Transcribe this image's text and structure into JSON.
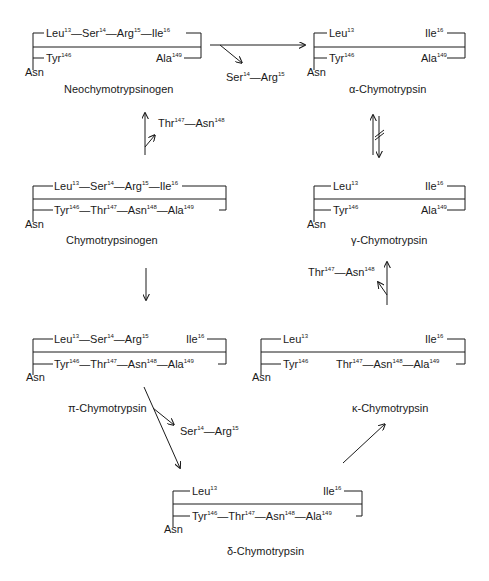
{
  "species": {
    "neochymotrypsinogen": {
      "name": "Neochymotrypsinogen",
      "top": [
        {
          "r": "Leu",
          "n": "13"
        },
        {
          "r": "Ser",
          "n": "14"
        },
        {
          "r": "Arg",
          "n": "15"
        },
        {
          "r": "Ile",
          "n": "16"
        }
      ],
      "bottom_left": {
        "r": "Tyr",
        "n": "146"
      },
      "bottom_right": {
        "r": "Ala",
        "n": "149"
      },
      "terminal": "Asn"
    },
    "alpha": {
      "name": "α-Chymotrypsin",
      "top_left": {
        "r": "Leu",
        "n": "13"
      },
      "top_right": {
        "r": "Ile",
        "n": "16"
      },
      "bottom_left": {
        "r": "Tyr",
        "n": "146"
      },
      "bottom_right": {
        "r": "Ala",
        "n": "149"
      },
      "terminal": "Asn"
    },
    "chymotrypsinogen": {
      "name": "Chymotrypsinogen",
      "top": [
        {
          "r": "Leu",
          "n": "13"
        },
        {
          "r": "Ser",
          "n": "14"
        },
        {
          "r": "Arg",
          "n": "15"
        },
        {
          "r": "Ile",
          "n": "16"
        }
      ],
      "bottom": [
        {
          "r": "Tyr",
          "n": "146"
        },
        {
          "r": "Thr",
          "n": "147"
        },
        {
          "r": "Asn",
          "n": "148"
        },
        {
          "r": "Ala",
          "n": "149"
        }
      ],
      "terminal": "Asn"
    },
    "gamma": {
      "name": "γ-Chymotrypsin",
      "top_left": {
        "r": "Leu",
        "n": "13"
      },
      "top_right": {
        "r": "Ile",
        "n": "16"
      },
      "bottom_left": {
        "r": "Tyr",
        "n": "146"
      },
      "bottom_right": {
        "r": "Ala",
        "n": "149"
      },
      "terminal": "Asn"
    },
    "pi": {
      "name": "π-Chymotrypsin",
      "top": [
        {
          "r": "Leu",
          "n": "13"
        },
        {
          "r": "Ser",
          "n": "14"
        },
        {
          "r": "Arg",
          "n": "15"
        }
      ],
      "top_right": {
        "r": "Ile",
        "n": "16"
      },
      "bottom": [
        {
          "r": "Tyr",
          "n": "146"
        },
        {
          "r": "Thr",
          "n": "147"
        },
        {
          "r": "Asn",
          "n": "148"
        },
        {
          "r": "Ala",
          "n": "149"
        }
      ],
      "terminal": "Asn"
    },
    "kappa": {
      "name": "κ-Chymotrypsin",
      "top_left": {
        "r": "Leu",
        "n": "13"
      },
      "top_right": {
        "r": "Ile",
        "n": "16"
      },
      "bottom_left": {
        "r": "Tyr",
        "n": "146"
      },
      "bottom": [
        {
          "r": "Thr",
          "n": "147"
        },
        {
          "r": "Asn",
          "n": "148"
        },
        {
          "r": "Ala",
          "n": "149"
        }
      ],
      "terminal": "Asn"
    },
    "delta": {
      "name": "δ-Chymotrypsin",
      "top_left": {
        "r": "Leu",
        "n": "13"
      },
      "top_right": {
        "r": "Ile",
        "n": "16"
      },
      "bottom": [
        {
          "r": "Tyr",
          "n": "146"
        },
        {
          "r": "Thr",
          "n": "147"
        },
        {
          "r": "Asn",
          "n": "148"
        },
        {
          "r": "Ala",
          "n": "149"
        }
      ],
      "terminal": "Asn"
    }
  },
  "released_fragments": {
    "ser_arg_1": [
      {
        "r": "Ser",
        "n": "14"
      },
      {
        "r": "Arg",
        "n": "15"
      }
    ],
    "thr_asn_1": [
      {
        "r": "Thr",
        "n": "147"
      },
      {
        "r": "Asn",
        "n": "148"
      }
    ],
    "thr_asn_2": [
      {
        "r": "Thr",
        "n": "147"
      },
      {
        "r": "Asn",
        "n": "148"
      }
    ],
    "ser_arg_2": [
      {
        "r": "Ser",
        "n": "14"
      },
      {
        "r": "Arg",
        "n": "15"
      }
    ]
  },
  "colors": {
    "ink": "#1a1a1a",
    "background": "#ffffff"
  }
}
